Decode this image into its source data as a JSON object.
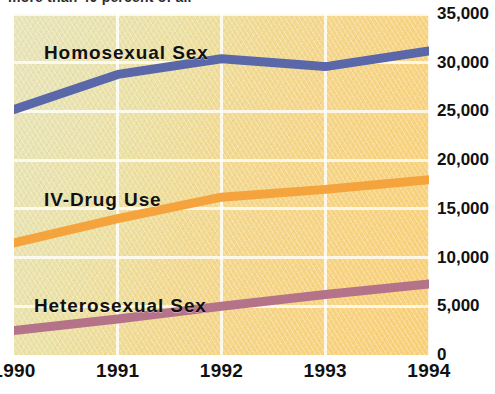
{
  "top_cut_headline": "more than 40 percent of all",
  "chart_data": {
    "type": "line",
    "title": "",
    "xlabel": "",
    "ylabel": "",
    "x": [
      "1990",
      "1991",
      "1992",
      "1993",
      "1994"
    ],
    "categories": [
      "1990",
      "1991",
      "1992",
      "1993",
      "1994"
    ],
    "ylim": [
      0,
      35000
    ],
    "ytick_values": [
      35000,
      30000,
      25000,
      20000,
      15000,
      10000,
      5000,
      0
    ],
    "ytick_labels": [
      "35,000",
      "30,000",
      "25,000",
      "20,000",
      "15,000",
      "10,000",
      "5,000",
      "0"
    ],
    "grid": true,
    "legend_position": "inline-labels",
    "series": [
      {
        "name": "Homosexual Sex",
        "color": "#5a68aa",
        "values": [
          25200,
          28800,
          30400,
          29600,
          31200
        ]
      },
      {
        "name": "IV-Drug Use",
        "color": "#f5a33c",
        "values": [
          11500,
          14000,
          16200,
          17000,
          18000
        ]
      },
      {
        "name": "Heterosexual Sex",
        "color": "#b5738a",
        "values": [
          2500,
          3700,
          5000,
          6200,
          7300
        ]
      }
    ]
  },
  "series_label_positions": [
    {
      "left": 30,
      "top": 28
    },
    {
      "left": 30,
      "top": 175
    },
    {
      "left": 20,
      "top": 281
    }
  ],
  "colors": {
    "plot_background_light": "#e8e5bc",
    "plot_background_dark": "#fad07a",
    "gridline": "#ffffff",
    "text": "#111111"
  }
}
